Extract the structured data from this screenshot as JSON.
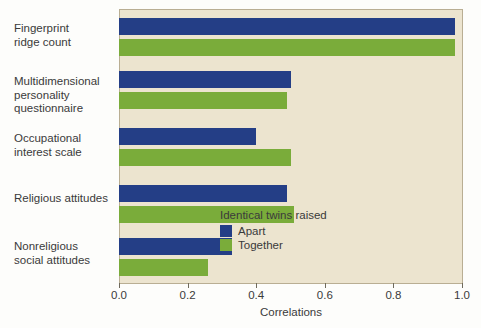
{
  "chart_data": {
    "type": "bar",
    "orientation": "horizontal",
    "title": "",
    "xlabel": "Correlations",
    "ylabel": "",
    "xlim": [
      0.0,
      1.0
    ],
    "grid": false,
    "legend_position": "inside-lower-right",
    "categories": [
      "Fingerprint ridge count",
      "Multidimensional personality questionnaire",
      "Occupational interest scale",
      "Religious attitudes",
      "Nonreligious social attitudes"
    ],
    "category_lines": [
      [
        "Fingerprint",
        "ridge count"
      ],
      [
        "Multidimensional",
        "personality",
        "questionnaire"
      ],
      [
        "Occupational",
        "interest scale"
      ],
      [
        "Religious attitudes"
      ],
      [
        "Nonreligious",
        "social attitudes"
      ]
    ],
    "series": [
      {
        "name": "Apart",
        "color": "#243e86",
        "values": [
          0.98,
          0.5,
          0.4,
          0.49,
          0.33
        ]
      },
      {
        "name": "Together",
        "color": "#7aac3a",
        "values": [
          0.98,
          0.49,
          0.5,
          0.51,
          0.26
        ]
      }
    ],
    "xticks": [
      0.0,
      0.2,
      0.4,
      0.6,
      0.8,
      1.0
    ],
    "xtick_labels": [
      "0.0",
      "0.2",
      "0.4",
      "0.6",
      "0.8",
      "1.0"
    ]
  },
  "legend": {
    "title": "Identical twins raised",
    "entries": [
      {
        "label": "Apart",
        "color": "#243e86"
      },
      {
        "label": "Together",
        "color": "#7aac3a"
      }
    ]
  },
  "colors": {
    "plot_background": "#ece4cf",
    "plot_border": "#b9ae93",
    "apart": "#243e86",
    "together": "#7aac3a",
    "text": "#3a3a3a",
    "page_background": "#fdfdfb"
  }
}
